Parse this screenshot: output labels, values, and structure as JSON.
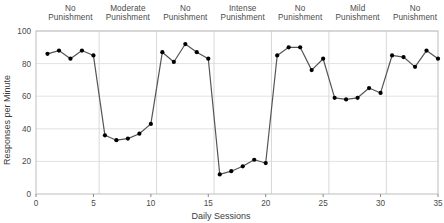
{
  "chart_data": {
    "type": "line",
    "title": "",
    "xlabel": "Daily Sessions",
    "ylabel": "Responses per Minute",
    "xlim": [
      0,
      35
    ],
    "ylim": [
      0,
      100
    ],
    "xticks": [
      0,
      5,
      10,
      15,
      20,
      25,
      30,
      35
    ],
    "yticks": [
      0,
      20,
      40,
      60,
      80,
      100
    ],
    "grid": true,
    "legend": "none",
    "marker": "filled-circle",
    "line_color": "#555555",
    "marker_color": "#000000",
    "x": [
      1,
      2,
      3,
      4,
      5,
      6,
      7,
      8,
      9,
      10,
      11,
      12,
      13,
      14,
      15,
      16,
      17,
      18,
      19,
      20,
      21,
      22,
      23,
      24,
      25,
      26,
      27,
      28,
      29,
      30,
      31,
      32,
      33,
      34,
      35
    ],
    "values": [
      86,
      88,
      83,
      88,
      85,
      36,
      33,
      34,
      37,
      43,
      87,
      81,
      92,
      87,
      83,
      12,
      14,
      17,
      21,
      19,
      85,
      90,
      90,
      76,
      83,
      59,
      58,
      59,
      65,
      62,
      85,
      84,
      78,
      88,
      83
    ],
    "phases": [
      {
        "label_line1": "No",
        "label_line2": "Punishment",
        "start": 1,
        "end": 5
      },
      {
        "label_line1": "Moderate",
        "label_line2": "Punishment",
        "start": 6,
        "end": 10
      },
      {
        "label_line1": "No",
        "label_line2": "Punishment",
        "start": 11,
        "end": 15
      },
      {
        "label_line1": "Intense",
        "label_line2": "Punishment",
        "start": 16,
        "end": 20
      },
      {
        "label_line1": "No",
        "label_line2": "Punishment",
        "start": 21,
        "end": 25
      },
      {
        "label_line1": "Mild",
        "label_line2": "Punishment",
        "start": 26,
        "end": 30
      },
      {
        "label_line1": "No",
        "label_line2": "Punishment",
        "start": 31,
        "end": 35
      }
    ],
    "phase_dividers": [
      5.5,
      10.5,
      15.5,
      20.5,
      25.5,
      30.5
    ]
  }
}
